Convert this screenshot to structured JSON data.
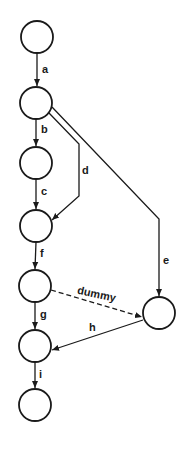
{
  "diagram": {
    "type": "flow-graph",
    "colors": {
      "stroke": "#1a1a1a",
      "background": "#ffffff"
    },
    "nodes": [
      {
        "id": "n1",
        "cx": 37,
        "cy": 37,
        "r": 16
      },
      {
        "id": "n2",
        "cx": 36,
        "cy": 103,
        "r": 16
      },
      {
        "id": "n3",
        "cx": 36,
        "cy": 163,
        "r": 16
      },
      {
        "id": "n4",
        "cx": 36,
        "cy": 226,
        "r": 16
      },
      {
        "id": "n5",
        "cx": 35,
        "cy": 286,
        "r": 16
      },
      {
        "id": "n6",
        "cx": 35,
        "cy": 346,
        "r": 16
      },
      {
        "id": "n7",
        "cx": 35,
        "cy": 405,
        "r": 16
      },
      {
        "id": "n8",
        "cx": 159,
        "cy": 313,
        "r": 16
      }
    ],
    "edges": [
      {
        "id": "a",
        "label": "a",
        "from": "n1",
        "to": "n2",
        "style": "solid"
      },
      {
        "id": "b",
        "label": "b",
        "from": "n2",
        "to": "n3",
        "style": "solid"
      },
      {
        "id": "c",
        "label": "c",
        "from": "n3",
        "to": "n4",
        "style": "solid"
      },
      {
        "id": "d",
        "label": "d",
        "from": "n2",
        "to": "n4",
        "style": "solid"
      },
      {
        "id": "e",
        "label": "e",
        "from": "n2",
        "to": "n8",
        "style": "solid"
      },
      {
        "id": "f",
        "label": "f",
        "from": "n4",
        "to": "n5",
        "style": "solid"
      },
      {
        "id": "dummy",
        "label": "dummy",
        "from": "n5",
        "to": "n8",
        "style": "dashed"
      },
      {
        "id": "g",
        "label": "g",
        "from": "n5",
        "to": "n6",
        "style": "solid"
      },
      {
        "id": "h",
        "label": "h",
        "from": "n8",
        "to": "n6",
        "style": "solid"
      },
      {
        "id": "i",
        "label": "i",
        "from": "n6",
        "to": "n7",
        "style": "solid"
      }
    ]
  }
}
